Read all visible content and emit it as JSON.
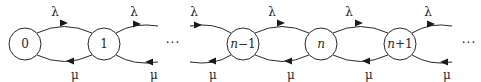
{
  "diagram": {
    "type": "birth-death-markov-chain",
    "states": [
      {
        "id": "s0",
        "label": "0",
        "cx": 25,
        "cy": 44
      },
      {
        "id": "s1",
        "label": "1",
        "cx": 104,
        "cy": 44
      },
      {
        "id": "sn-1",
        "label": "n−1",
        "cx": 243,
        "cy": 44,
        "italic_prefix": "n",
        "suffix": "−1"
      },
      {
        "id": "sn",
        "label": "n",
        "cx": 321,
        "cy": 44,
        "italic_prefix": "n",
        "suffix": ""
      },
      {
        "id": "sn+1",
        "label": "n+1",
        "cx": 400,
        "cy": 44,
        "italic_prefix": "n",
        "suffix": "+1"
      }
    ],
    "state_radius": 16,
    "ellipsis": [
      "···",
      "···"
    ],
    "arrival_rate_label": "λ",
    "service_rate_label": "μ",
    "arrival_labels": [
      "λ",
      "λ",
      "λ",
      "λ",
      "λ",
      "λ"
    ],
    "service_labels": [
      "μ",
      "μ",
      "μ",
      "μ",
      "μ",
      "μ"
    ],
    "transitions": [
      {
        "from": "0",
        "to": "1",
        "rate": "λ"
      },
      {
        "from": "1",
        "to": "0",
        "rate": "μ"
      },
      {
        "from": "1",
        "to": "···",
        "rate": "λ"
      },
      {
        "from": "···",
        "to": "1",
        "rate": "μ"
      },
      {
        "from": "···",
        "to": "n−1",
        "rate": "λ"
      },
      {
        "from": "n−1",
        "to": "···",
        "rate": "μ"
      },
      {
        "from": "n−1",
        "to": "n",
        "rate": "λ"
      },
      {
        "from": "n",
        "to": "n−1",
        "rate": "μ"
      },
      {
        "from": "n",
        "to": "n+1",
        "rate": "λ"
      },
      {
        "from": "n+1",
        "to": "n",
        "rate": "μ"
      },
      {
        "from": "n+1",
        "to": "···",
        "rate": "λ"
      },
      {
        "from": "···",
        "to": "n+1",
        "rate": "μ"
      }
    ]
  }
}
